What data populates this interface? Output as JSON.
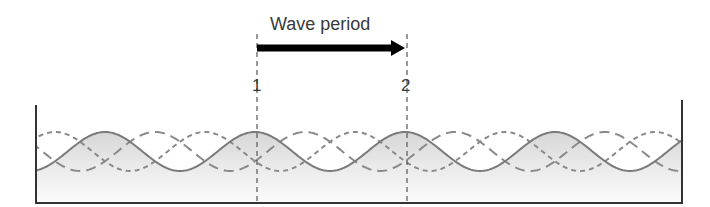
{
  "diagram": {
    "title": "Wave period",
    "markers": [
      {
        "label": "1",
        "x": 257
      },
      {
        "label": "2",
        "x": 407
      }
    ],
    "arrow": {
      "from_x": 257,
      "to_x": 405,
      "y": 48,
      "direction": "right",
      "color": "#000000"
    },
    "tank": {
      "left": 36,
      "right": 682,
      "floor": 203,
      "left_top": 105,
      "right_top": 100,
      "stroke": "#333333"
    },
    "waves": {
      "period_px": 150,
      "crest_y": 132,
      "trough_y": 171,
      "series": [
        {
          "name": "solid-wave",
          "style": "solid",
          "crest_x": 105,
          "color": "#7a7a7a"
        },
        {
          "name": "short-dash-wave",
          "style": "short-dash",
          "crest_x": 55,
          "color": "#8a8a8a"
        },
        {
          "name": "long-dash-wave",
          "style": "long-dash",
          "crest_x": 155,
          "color": "#8a8a8a"
        }
      ]
    },
    "colors": {
      "water_fill_top": "#dedede",
      "water_fill_bottom": "#fafafa",
      "text": "#3a3a3a"
    }
  }
}
